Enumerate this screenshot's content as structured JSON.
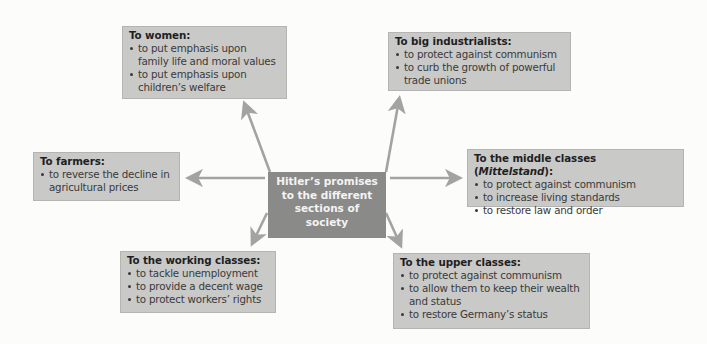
{
  "center": {
    "lines": [
      "Hitler’s promises",
      "to the different",
      "sections of",
      "society"
    ]
  },
  "boxes": {
    "women": {
      "title": "To women:",
      "items": [
        {
          "line1": "to put emphasis upon",
          "line2": "family life and moral values"
        },
        {
          "line1": "to put emphasis upon",
          "line2": "children’s welfare"
        }
      ]
    },
    "industrialists": {
      "title": "To big industrialists:",
      "items": [
        {
          "line1": "to protect against communism"
        },
        {
          "line1": "to curb the growth of powerful",
          "line2": "trade unions"
        }
      ]
    },
    "farmers": {
      "title": "To farmers:",
      "items": [
        {
          "line1": "to reverse the decline in",
          "line2": "agricultural prices"
        }
      ]
    },
    "middle": {
      "title_prefix": "To the middle classes (",
      "title_italic": "Mittelstand",
      "title_suffix": "):",
      "items": [
        {
          "line1": "to protect against communism"
        },
        {
          "line1": "to increase living standards"
        },
        {
          "line1": "to restore law and order"
        }
      ]
    },
    "working": {
      "title": "To the working classes:",
      "items": [
        {
          "line1": "to tackle unemployment"
        },
        {
          "line1": "to provide a decent wage"
        },
        {
          "line1": "to protect workers’ rights"
        }
      ]
    },
    "upper": {
      "title": "To the upper classes:",
      "items": [
        {
          "line1": "to protect against communism"
        },
        {
          "line1": "to allow them to keep their wealth",
          "line2": "and status"
        },
        {
          "line1": "to restore Germany’s status"
        }
      ]
    }
  },
  "colors": {
    "box_fill": "#c9c9c8",
    "center_fill": "#8a8a89",
    "arrow": "#a3a3a2",
    "background": "#fcfcfb"
  }
}
